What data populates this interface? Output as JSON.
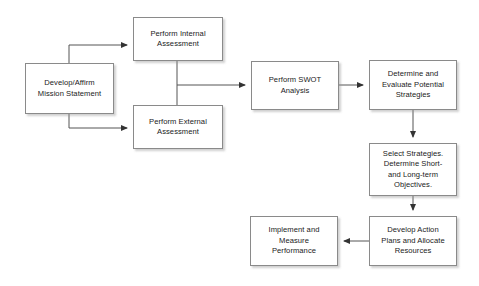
{
  "diagram": {
    "background_color": "#ffffff",
    "box_border_color": "#8a8a8a",
    "box_fill_color": "#ffffff",
    "connector_color": "#555555",
    "text_color": "#1a1a1a",
    "nodes": [
      {
        "id": "mission",
        "label": "Develop/Affirm\nMission Statement",
        "x": 25,
        "y": 63,
        "w": 89,
        "h": 51
      },
      {
        "id": "internal",
        "label": "Perform Internal\nAssessment",
        "x": 133,
        "y": 17,
        "w": 90,
        "h": 44
      },
      {
        "id": "external",
        "label": "Perform External\nAssessment",
        "x": 133,
        "y": 105,
        "w": 90,
        "h": 44
      },
      {
        "id": "swot",
        "label": "Perform SWOT\nAnalysis",
        "x": 251,
        "y": 61,
        "w": 88,
        "h": 49
      },
      {
        "id": "determine",
        "label": "Determine and\nEvaluate Potential\nStrategies",
        "x": 369,
        "y": 60,
        "w": 88,
        "h": 50
      },
      {
        "id": "select",
        "label": "Select Strategies.\nDetermine Short-\nand Long-term\nObjectives.",
        "x": 369,
        "y": 143,
        "w": 88,
        "h": 53
      },
      {
        "id": "develop-action",
        "label": "Develop Action\nPlans and Allocate\nResources",
        "x": 369,
        "y": 216,
        "w": 88,
        "h": 50
      },
      {
        "id": "implement",
        "label": "Implement and\nMeasure\nPerformance",
        "x": 250,
        "y": 216,
        "w": 88,
        "h": 50
      }
    ],
    "connectors": [
      {
        "id": "mission-to-internal",
        "from": "mission",
        "to": "internal",
        "path": "M 69 63 L 69 45 L 127 45"
      },
      {
        "id": "mission-to-external",
        "from": "mission",
        "to": "external",
        "path": "M 69 114 L 69 128 L 127 128"
      },
      {
        "id": "internal-to-external-spine",
        "from": "internal",
        "to": "external",
        "path": "M 177 61 L 177 105"
      },
      {
        "id": "assessments-to-swot",
        "from": "internal",
        "to": "swot",
        "path": "M 177 85 L 245 85"
      },
      {
        "id": "swot-to-determine",
        "from": "swot",
        "to": "determine",
        "path": "M 339 85 L 363 85"
      },
      {
        "id": "determine-to-select",
        "from": "determine",
        "to": "select",
        "path": "M 413 110 L 413 137"
      },
      {
        "id": "select-to-develop-action",
        "from": "select",
        "to": "develop-action",
        "path": "M 413 196 L 413 210"
      },
      {
        "id": "develop-action-to-implement",
        "from": "develop-action",
        "to": "implement",
        "path": "M 369 241 L 344 241"
      }
    ]
  }
}
